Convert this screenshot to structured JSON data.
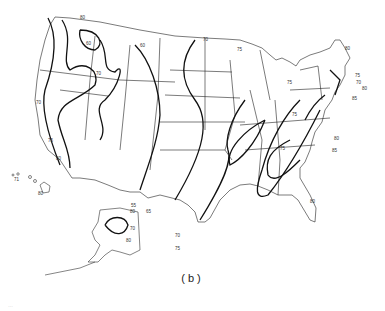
{
  "figure": {
    "caption": "(b)",
    "footnote": "…",
    "map_type": "isoline map of the United States",
    "regions_shown": [
      "Contiguous United States",
      "Alaska",
      "Hawaii"
    ],
    "line_color": "#111111",
    "background_color": "#ffffff"
  },
  "contour_labels": {
    "west_coast": [
      "80",
      "60",
      "70",
      "75",
      "80",
      "70",
      "60"
    ],
    "great_plains": [
      "60",
      "65",
      "70",
      "75"
    ],
    "upper_midwest": [
      "70",
      "75"
    ],
    "great_lakes": [
      "75"
    ],
    "northeast": [
      "80",
      "80",
      "75",
      "70",
      "80",
      "85"
    ],
    "appalachians": [
      "75",
      "75",
      "80",
      "85"
    ],
    "southeast": [
      "80",
      "85"
    ],
    "texas_gulf": [
      "55",
      "60",
      "70",
      "75"
    ],
    "alaska": [
      "80",
      "70",
      "80",
      "75"
    ],
    "hawaii": [
      "75",
      "71",
      "80"
    ]
  }
}
